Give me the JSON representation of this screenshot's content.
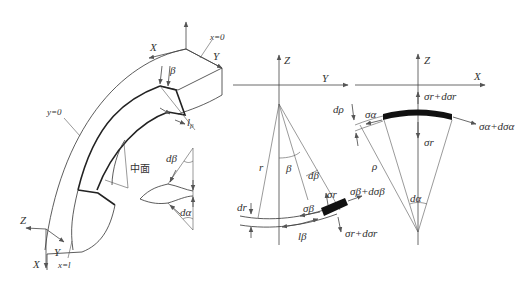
{
  "figure": {
    "panel_left": {
      "axes": {
        "x": "X",
        "y": "Y",
        "z": "Z"
      },
      "planes": {
        "x0": "x=0",
        "y0": "y=0",
        "xl": "x=l"
      },
      "labels": {
        "beta": "β",
        "l_beta": "l",
        "l_beta_sub": "β",
        "mid_surface": "中面"
      },
      "element": {
        "d_beta": "dβ",
        "d_alpha": "dα"
      }
    },
    "panel_middle": {
      "axes": {
        "z": "Z",
        "y": "Y"
      },
      "labels": {
        "r": "r",
        "beta": "β",
        "d_beta": "dβ",
        "dr": "dr",
        "sigma_beta": "σβ",
        "sigma_r": "σr",
        "sigma_beta_d": "σβ+dσβ",
        "sigma_r_d": "σr+dσr",
        "l_beta": "lβ"
      }
    },
    "panel_right": {
      "axes": {
        "z": "Z",
        "x": "X"
      },
      "labels": {
        "d_rho": "dρ",
        "sigma_alpha": "σα",
        "rho": "ρ",
        "sigma_r": "σr",
        "sigma_r_d": "σr+dσr",
        "sigma_alpha_d": "σα+dσα",
        "d_alpha": "dα"
      }
    }
  }
}
